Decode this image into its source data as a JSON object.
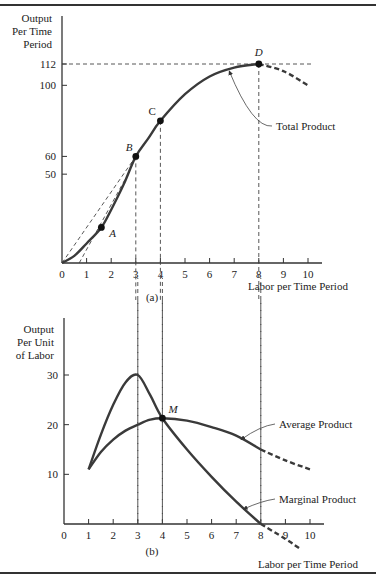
{
  "chart_data": [
    {
      "id": "a",
      "type": "line",
      "panel_label": "(a)",
      "title": "",
      "ylabel": [
        "Output",
        "Per Time",
        "Period"
      ],
      "xlabel": "Labor per Time Period",
      "xlim": [
        0,
        10
      ],
      "ylim": [
        0,
        112
      ],
      "x_ticks": [
        "0",
        "1",
        "2",
        "3",
        "4",
        "5",
        "6",
        "7",
        "8",
        "9",
        "10"
      ],
      "y_ticks": [
        {
          "value": 112,
          "label": "112"
        },
        {
          "value": 100,
          "label": "100"
        },
        {
          "value": 60,
          "label": "60"
        },
        {
          "value": 50,
          "label": "50"
        }
      ],
      "grid": false,
      "series": [
        {
          "name": "Total Product",
          "x": [
            0,
            0.5,
            1,
            1.6,
            2,
            2.5,
            3,
            3.5,
            4,
            5,
            6,
            7,
            8
          ],
          "values": [
            0,
            4,
            11,
            20,
            30,
            44,
            60,
            70,
            80,
            95,
            105,
            110,
            112
          ],
          "style": "solid"
        },
        {
          "name": "Total Product (declining)",
          "x": [
            8,
            9,
            10
          ],
          "values": [
            112,
            108,
            100
          ],
          "style": "dashed"
        }
      ],
      "points": [
        {
          "label": "A",
          "x": 1.6,
          "y": 20
        },
        {
          "label": "B",
          "x": 3,
          "y": 60
        },
        {
          "label": "C",
          "x": 4,
          "y": 80
        },
        {
          "label": "D",
          "x": 8,
          "y": 112
        }
      ],
      "reference_lines": [
        {
          "type": "horizontal",
          "y": 112,
          "style": "dashed"
        },
        {
          "type": "vertical",
          "x": 3,
          "style": "dashed"
        },
        {
          "type": "vertical",
          "x": 4,
          "style": "dashed"
        },
        {
          "type": "vertical",
          "x": 8,
          "style": "dashed"
        },
        {
          "type": "ray",
          "from": [
            0,
            0
          ],
          "to": [
            3,
            60
          ],
          "style": "dashed",
          "note": "ray from origin to B"
        },
        {
          "type": "tangent",
          "from": [
            0.7,
            0
          ],
          "to": [
            2.6,
            48
          ],
          "style": "dashed",
          "note": "tangent at A"
        }
      ],
      "annotations": [
        {
          "text": "Total Product",
          "arrow_to": [
            6.8,
            108
          ]
        }
      ]
    },
    {
      "id": "b",
      "type": "line",
      "panel_label": "(b)",
      "title": "",
      "ylabel": [
        "Output",
        "Per Unit",
        "of Labor"
      ],
      "xlabel": "Labor per Time Period",
      "xlim": [
        0,
        10
      ],
      "ylim": [
        0,
        30
      ],
      "x_ticks": [
        "0",
        "1",
        "2",
        "3",
        "4",
        "5",
        "6",
        "7",
        "8",
        "9",
        "10"
      ],
      "y_ticks": [
        {
          "value": 30,
          "label": "30"
        },
        {
          "value": 20,
          "label": "20"
        },
        {
          "value": 10,
          "label": "10"
        }
      ],
      "grid": false,
      "series": [
        {
          "name": "Average Product",
          "x": [
            1,
            1.5,
            2,
            2.5,
            3,
            3.5,
            4,
            5,
            6,
            7,
            8
          ],
          "values": [
            11,
            14.5,
            17,
            18.8,
            20,
            21,
            21.3,
            20.8,
            19.5,
            17.8,
            15
          ],
          "style": "solid"
        },
        {
          "name": "Average Product (extended)",
          "x": [
            8,
            9,
            10
          ],
          "values": [
            15,
            12.8,
            11
          ],
          "style": "dashed"
        },
        {
          "name": "Marginal Product",
          "x": [
            1,
            1.5,
            2,
            2.5,
            3,
            3.5,
            4,
            5,
            6,
            7,
            8
          ],
          "values": [
            11,
            18,
            24,
            28.5,
            30,
            26,
            21.3,
            15,
            9.5,
            4.5,
            0
          ],
          "style": "solid"
        },
        {
          "name": "Marginal Product (negative)",
          "x": [
            8,
            9,
            9.6
          ],
          "values": [
            0,
            -3,
            -5
          ],
          "style": "dashed"
        }
      ],
      "points": [
        {
          "label": "M",
          "x": 4,
          "y": 21.3
        }
      ],
      "reference_lines": [
        {
          "type": "vertical",
          "x": 3,
          "style": "dashed"
        },
        {
          "type": "vertical",
          "x": 4,
          "style": "dashed"
        },
        {
          "type": "vertical",
          "x": 8,
          "style": "dashed"
        }
      ],
      "annotations": [
        {
          "text": "Average Product",
          "arrow_to": [
            7.2,
            17
          ]
        },
        {
          "text": "Marginal Product",
          "arrow_to": [
            7.3,
            3
          ]
        }
      ]
    }
  ]
}
